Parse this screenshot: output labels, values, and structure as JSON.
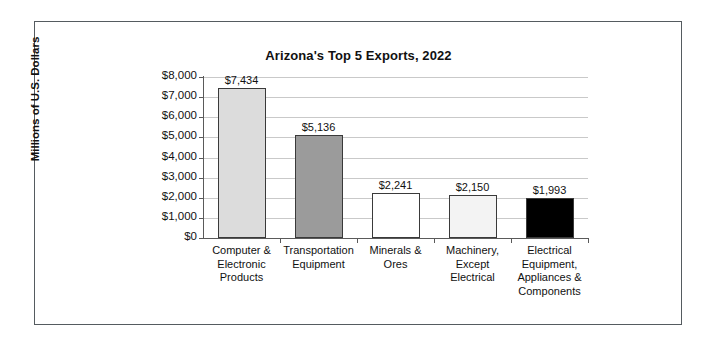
{
  "frame": {
    "border_color": "#555b60",
    "background": "#ffffff"
  },
  "chart_data": {
    "type": "bar",
    "title": "Arizona's Top 5 Exports, 2022",
    "xlabel": "",
    "ylabel": "Millions of U.S. Dollars",
    "ylim": [
      0,
      8000
    ],
    "ytick_step": 1000,
    "grid": true,
    "legend": "none",
    "categories": [
      "Computer & Electronic Products",
      "Transportation Equipment",
      "Minerals & Ores",
      "Machinery, Except Electrical",
      "Electrical Equipment, Appliances & Components"
    ],
    "category_lines": [
      [
        "Computer &",
        "Electronic",
        "Products"
      ],
      [
        "Transportation",
        "Equipment"
      ],
      [
        "Minerals &",
        "Ores"
      ],
      [
        "Machinery,",
        "Except",
        "Electrical"
      ],
      [
        "Electrical",
        "Equipment,",
        "Appliances &",
        "Components"
      ]
    ],
    "values": [
      7434,
      5136,
      2241,
      2150,
      1993
    ],
    "value_labels": [
      "$7,434",
      "$5,136",
      "$2,241",
      "$2,150",
      "$1,993"
    ],
    "bar_colors": [
      "#dcdcdc",
      "#9b9b9b",
      "#ffffff",
      "#f3f3f3",
      "#000000"
    ],
    "bar_border_color": "#3a3a3a",
    "ytick_labels": [
      "$8,000",
      "$7,000",
      "$6,000",
      "$5,000",
      "$4,000",
      "$3,000",
      "$2,000",
      "$1,000",
      "$0"
    ],
    "ytick_values": [
      8000,
      7000,
      6000,
      5000,
      4000,
      3000,
      2000,
      1000,
      0
    ],
    "gridline_color": "#c9c9c9",
    "axis_color": "#5a5a5a"
  }
}
